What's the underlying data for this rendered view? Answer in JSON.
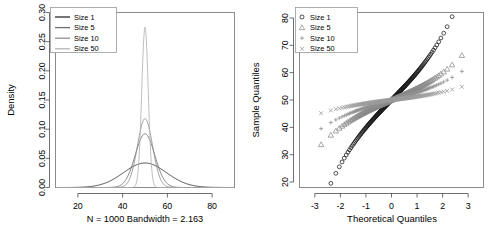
{
  "figure": {
    "title": "",
    "panel_count": 2
  },
  "chart_data": [
    {
      "type": "line",
      "panel": "left",
      "title": "",
      "xlabel": "N = 1000   Bandwidth = 2.163",
      "ylabel": "Density",
      "xlim": [
        10,
        90
      ],
      "ylim": [
        0,
        0.3
      ],
      "xticks": [
        20,
        40,
        60,
        80
      ],
      "yticks": [
        "0.00",
        "0.05",
        "0.10",
        "0.15",
        "0.20",
        "0.25",
        "0.30"
      ],
      "ytick_values": [
        0.0,
        0.05,
        0.1,
        0.15,
        0.2,
        0.25,
        0.3
      ],
      "grid": false,
      "legend_position": "top-left",
      "caption": "N = 1000   Bandwidth = 2.163",
      "sample_size_N": 1000,
      "bandwidth": 2.163,
      "series": [
        {
          "name": "Size 1",
          "color": "#2b2b2b",
          "mean": 50,
          "sd": 9.6,
          "peak": 0.042
        },
        {
          "name": "Size 5",
          "color": "#6e6e6e",
          "mean": 50,
          "sd": 4.35,
          "peak": 0.092
        },
        {
          "name": "Size 10",
          "color": "#8f8f8f",
          "mean": 50,
          "sd": 3.38,
          "peak": 0.118
        },
        {
          "name": "Size 50",
          "color": "#b4b4b4",
          "mean": 50,
          "sd": 1.45,
          "peak": 0.275
        }
      ]
    },
    {
      "type": "scatter",
      "panel": "right",
      "title": "",
      "xlabel": "Theoretical Quantiles",
      "ylabel": "Sample Quantiles",
      "xlim": [
        -3.6,
        3.6
      ],
      "ylim": [
        18,
        82
      ],
      "xticks": [
        -3,
        -2,
        -1,
        0,
        1,
        2,
        3
      ],
      "yticks": [
        20,
        30,
        40,
        50,
        60,
        70,
        80
      ],
      "grid": false,
      "legend_position": "top-left",
      "series": [
        {
          "name": "Size 1",
          "marker": "circle",
          "color": "#1a1a1a",
          "intercept": 50,
          "slope": 9.6,
          "y_min": 21,
          "y_max": 79
        },
        {
          "name": "Size 5",
          "marker": "triangle",
          "color": "#8a8a8a",
          "intercept": 50,
          "slope": 4.05,
          "y_min": 38,
          "y_max": 62
        },
        {
          "name": "Size 10",
          "marker": "plus",
          "color": "#909090",
          "intercept": 50,
          "slope": 2.6,
          "y_min": 42.5,
          "y_max": 57.5
        },
        {
          "name": "Size 50",
          "marker": "cross",
          "color": "#9a9a9a",
          "intercept": 50,
          "slope": 1.2,
          "y_min": 46.5,
          "y_max": 53.2
        }
      ]
    }
  ],
  "left_panel": {
    "ylabel": "Density",
    "caption": "N = 1000   Bandwidth = 2.163",
    "xtick_labels": [
      "20",
      "40",
      "60",
      "80"
    ],
    "ytick_labels": [
      "0.00",
      "0.05",
      "0.10",
      "0.15",
      "0.20",
      "0.25",
      "0.30"
    ],
    "legend": {
      "items": [
        {
          "label": "Size 1"
        },
        {
          "label": "Size 5"
        },
        {
          "label": "Size 10"
        },
        {
          "label": "Size 50"
        }
      ]
    }
  },
  "right_panel": {
    "ylabel": "Sample Quantiles",
    "xlabel": "Theoretical Quantiles",
    "xtick_labels": [
      "-3",
      "-2",
      "-1",
      "0",
      "1",
      "2",
      "3"
    ],
    "ytick_labels": [
      "20",
      "30",
      "40",
      "50",
      "60",
      "70",
      "80"
    ],
    "legend": {
      "items": [
        {
          "label": "Size 1"
        },
        {
          "label": "Size 5"
        },
        {
          "label": "Size 10"
        },
        {
          "label": "Size 50"
        }
      ]
    }
  }
}
